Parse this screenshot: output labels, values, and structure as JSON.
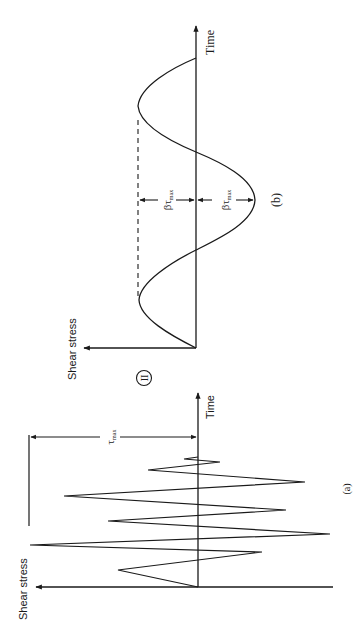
{
  "figure": {
    "orientation": "rotated 90 degrees counter-clockwise",
    "separator_symbol": "II",
    "panels": [
      {
        "id": "a",
        "caption": "(a)",
        "y_axis_label": "Shear stress",
        "x_axis_label": "Time",
        "dimension_label": "τ",
        "dimension_label_sub": "max",
        "description": "Irregular seismic shear stress time history"
      },
      {
        "id": "b",
        "caption": "(b)",
        "y_axis_label": "Shear stress",
        "x_axis_label": "Time",
        "upper_amplitude_label": "βτ",
        "upper_amplitude_sub": "max",
        "lower_amplitude_label": "βτ",
        "lower_amplitude_sub": "max",
        "description": "Equivalent uniform sinusoidal shear stress cycles"
      }
    ]
  },
  "colors": {
    "ink": "#1a1a1a",
    "background": "#ffffff"
  }
}
